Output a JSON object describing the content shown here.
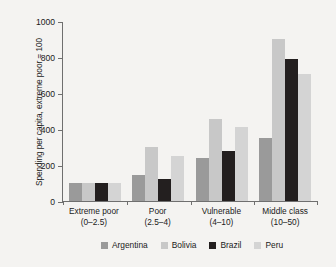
{
  "chart_data": {
    "type": "bar",
    "title": "",
    "xlabel": "",
    "ylabel": "Spending per capita, extreme poor = 100",
    "ylim": [
      0,
      1000
    ],
    "yticks": [
      "0",
      "200",
      "400",
      "600",
      "800",
      "1000"
    ],
    "grid": false,
    "legend_position": "bottom",
    "categories": [
      {
        "name": "Extreme poor",
        "range": "(0–2.5)"
      },
      {
        "name": "Poor",
        "range": "(2.5–4)"
      },
      {
        "name": "Vulnerable",
        "range": "(4–10)"
      },
      {
        "name": "Middle class",
        "range": "(10–50)"
      }
    ],
    "category_labels": [
      "Extreme poor",
      "Poor",
      "Vulnerable",
      "Middle class"
    ],
    "series": [
      {
        "name": "Argentina",
        "color": "#9a9a9a",
        "values": [
          100,
          143,
          240,
          352
        ]
      },
      {
        "name": "Bolivia",
        "color": "#c8c8c8",
        "values": [
          100,
          298,
          458,
          902
        ]
      },
      {
        "name": "Brazil",
        "color": "#231f1f",
        "values": [
          100,
          120,
          278,
          788
        ]
      },
      {
        "name": "Peru",
        "color": "#d4d4d4",
        "values": [
          100,
          252,
          412,
          706
        ]
      }
    ]
  },
  "axis": {
    "y_title": "Spending per capita, extreme poor = 100"
  }
}
